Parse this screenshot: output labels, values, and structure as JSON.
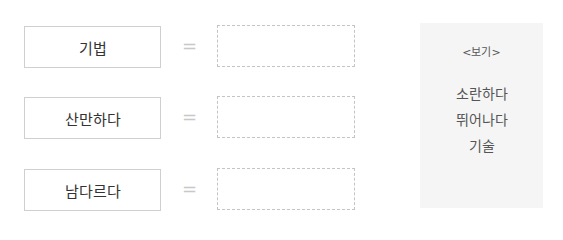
{
  "rows": [
    {
      "word": "기법",
      "symbol": "=",
      "answer": ""
    },
    {
      "word": "산만하다",
      "symbol": "=",
      "answer": ""
    },
    {
      "word": "남다르다",
      "symbol": "=",
      "answer": ""
    }
  ],
  "example_box": {
    "title": "<보기>",
    "items": [
      "소란하다",
      "뛰어나다",
      "기술"
    ]
  }
}
